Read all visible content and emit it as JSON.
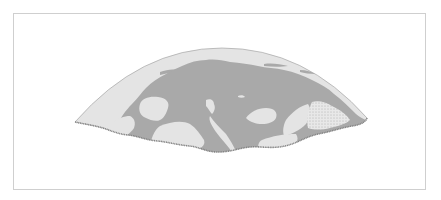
{
  "map": {
    "type": "map",
    "projection": "northern-hemisphere-arc",
    "title": "",
    "labels": [],
    "colors": {
      "ocean": "#e4e4e4",
      "land": "#a9a9a9",
      "outline": "#8c8c8c",
      "frame": "#cfcfcf",
      "stipple": "#7a7a7a",
      "background": "#ffffff"
    },
    "features": [
      {
        "name": "ocean-background",
        "kind": "water"
      },
      {
        "name": "main-landmass",
        "kind": "land"
      },
      {
        "name": "western-large-lake",
        "kind": "water"
      },
      {
        "name": "central-inlet",
        "kind": "water"
      },
      {
        "name": "eastern-sea",
        "kind": "water"
      },
      {
        "name": "small-lake",
        "kind": "water"
      },
      {
        "name": "stippled-region",
        "kind": "special-area"
      },
      {
        "name": "wavy-bottom-edge",
        "kind": "border"
      }
    ]
  }
}
